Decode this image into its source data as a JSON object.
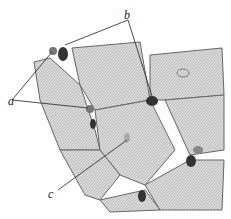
{
  "figure": {
    "type": "histology illustration",
    "labels": {
      "a": "a",
      "b": "b",
      "c": "c"
    }
  }
}
